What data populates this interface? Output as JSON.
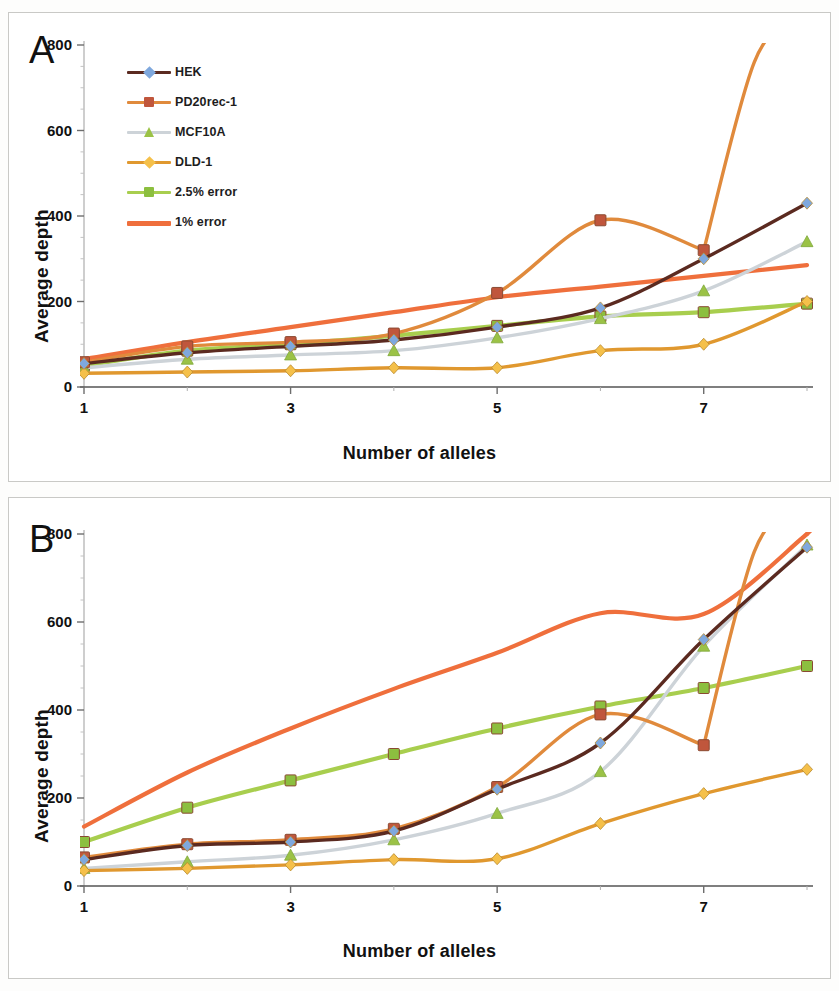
{
  "figure": {
    "background": "#fdfdfc",
    "panels": [
      "A",
      "B"
    ]
  },
  "panel_a": {
    "letter": "A",
    "xlabel": "Number of alleles",
    "ylabel": "Average depth"
  },
  "panel_b": {
    "letter": "B",
    "xlabel": "Number of alleles",
    "ylabel": "Average depth"
  },
  "legend": {
    "entries": [
      {
        "label": "HEK",
        "line": "#5b2a20",
        "marker": "#7fa8dd",
        "marker_shape": "diamond"
      },
      {
        "label": "PD20rec-1",
        "line": "#e08a3c",
        "marker": "#c0563c",
        "marker_shape": "square"
      },
      {
        "label": "MCF10A",
        "line": "#cdd3d8",
        "marker": "#9bc246",
        "marker_shape": "triangle"
      },
      {
        "label": "DLD-1",
        "line": "#e0982f",
        "marker": "#f5c04a",
        "marker_shape": "diamond"
      },
      {
        "label": "2.5% error",
        "line": "#a8ce4e",
        "marker": "#8cbf3f",
        "marker_shape": "square"
      },
      {
        "label": "1% error",
        "line": "#ef6f3c",
        "marker": "#ef6f3c",
        "marker_shape": "none"
      }
    ]
  },
  "chart_data": [
    {
      "type": "line",
      "panel": "A",
      "title": "",
      "xlabel": "Number of alleles",
      "ylabel": "Average depth",
      "x": [
        1,
        2,
        3,
        4,
        5,
        6,
        7,
        8
      ],
      "xticks": [
        1,
        3,
        5,
        7
      ],
      "xtick_all": [
        1,
        2,
        3,
        4,
        5,
        6,
        7,
        8
      ],
      "yticks": [
        0,
        200,
        400,
        600,
        800
      ],
      "xlim": [
        1,
        8
      ],
      "ylim": [
        0,
        800
      ],
      "grid": false,
      "legend_position": "top-left",
      "series": [
        {
          "name": "HEK",
          "values": [
            55,
            80,
            95,
            110,
            140,
            185,
            300,
            430
          ],
          "marker": "diamond",
          "line_color": "#5b2a20",
          "marker_color": "#7fa8dd"
        },
        {
          "name": "PD20rec-1",
          "values": [
            58,
            95,
            105,
            125,
            220,
            390,
            320,
            null
          ],
          "marker": "square",
          "line_color": "#e08a3c",
          "marker_color": "#c0563c"
        },
        {
          "name": "MCF10A",
          "values": [
            45,
            65,
            75,
            85,
            115,
            160,
            225,
            340
          ],
          "marker": "triangle",
          "line_color": "#cdd3d8",
          "marker_color": "#9bc246"
        },
        {
          "name": "DLD-1",
          "values": [
            32,
            35,
            38,
            45,
            45,
            85,
            100,
            200
          ],
          "marker": "diamond",
          "line_color": "#e0982f",
          "marker_color": "#f5c04a"
        },
        {
          "name": "2.5% error",
          "values": [
            50,
            85,
            100,
            120,
            143,
            165,
            175,
            195
          ],
          "marker": "square",
          "line_color": "#a8ce4e",
          "marker_color": "#8cbf3f"
        },
        {
          "name": "1% error",
          "values": [
            65,
            105,
            140,
            175,
            210,
            235,
            260,
            285
          ],
          "marker": "none",
          "line_color": "#ef6f3c",
          "marker_color": "#ef6f3c"
        }
      ],
      "notes": "PD20rec-1 peaks at x=6 (~390) then dips at x=7 (~320); DLD-1 rises off-scale past x=8 exceeding 800."
    },
    {
      "type": "line",
      "panel": "B",
      "title": "",
      "xlabel": "Number of alleles",
      "ylabel": "Average depth",
      "x": [
        1,
        2,
        3,
        4,
        5,
        6,
        7,
        8
      ],
      "xticks": [
        1,
        3,
        5,
        7
      ],
      "xtick_all": [
        1,
        2,
        3,
        4,
        5,
        6,
        7,
        8
      ],
      "yticks": [
        0,
        200,
        400,
        600,
        800
      ],
      "xlim": [
        1,
        8
      ],
      "ylim": [
        0,
        800
      ],
      "grid": false,
      "legend_position": "top-left",
      "series": [
        {
          "name": "HEK",
          "values": [
            60,
            92,
            100,
            125,
            220,
            325,
            560,
            770
          ],
          "marker": "diamond",
          "line_color": "#5b2a20",
          "marker_color": "#7fa8dd"
        },
        {
          "name": "PD20rec-1",
          "values": [
            65,
            95,
            105,
            130,
            225,
            390,
            320,
            null
          ],
          "marker": "square",
          "line_color": "#e08a3c",
          "marker_color": "#c0563c"
        },
        {
          "name": "MCF10A",
          "values": [
            40,
            55,
            70,
            105,
            165,
            260,
            545,
            775
          ],
          "marker": "triangle",
          "line_color": "#cdd3d8",
          "marker_color": "#9bc246"
        },
        {
          "name": "DLD-1",
          "values": [
            35,
            40,
            48,
            60,
            62,
            142,
            210,
            265
          ],
          "marker": "diamond",
          "line_color": "#e0982f",
          "marker_color": "#f5c04a"
        },
        {
          "name": "2.5% error",
          "values": [
            100,
            178,
            240,
            300,
            358,
            408,
            450,
            500
          ],
          "marker": "square",
          "line_color": "#a8ce4e",
          "marker_color": "#8cbf3f"
        },
        {
          "name": "1% error",
          "values": [
            135,
            258,
            358,
            448,
            530,
            620,
            618,
            800
          ],
          "marker": "none",
          "line_color": "#ef6f3c",
          "marker_color": "#ef6f3c"
        }
      ],
      "notes": "1% error plateaus near 620 between x=6 and x=7 then climbs steeply off-scale; PD20rec-1 dips at x=7 (~320) then rises steeply off-scale."
    }
  ]
}
